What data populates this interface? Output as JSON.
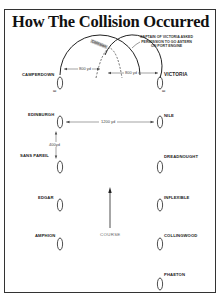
{
  "title": "How The Collision Occurred",
  "annotations": {
    "collision": "Collision",
    "captain_note": [
      "CAPTAIN OF VICTORIA ASKED",
      "PERMISSION TO GO ASTERN",
      "ON PORT ENGINE"
    ],
    "course": "COURSE"
  },
  "distances": {
    "camperdown_turn": "800 yd",
    "victoria_turn": "800 yd",
    "between_columns": "1200 yd",
    "between_ships": "400yd"
  },
  "port_column": {
    "ships": [
      "CAMPERDOWN",
      "EDINBURGH",
      "SANS PAREIL",
      "EDGAR",
      "AMPHION"
    ]
  },
  "starboard_column": {
    "ships": [
      "VICTORIA",
      "NILE",
      "DREADNOUGHT",
      "INFLEXIBLE",
      "COLLINGWOOD",
      "PHAETON"
    ]
  }
}
